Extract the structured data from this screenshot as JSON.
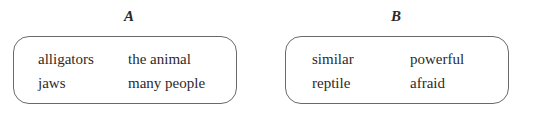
{
  "groups": [
    {
      "label": "A",
      "words": [
        "alligators",
        "the animal",
        "jaws",
        "many people"
      ]
    },
    {
      "label": "B",
      "words": [
        "similar",
        "powerful",
        "reptile",
        "afraid"
      ]
    }
  ]
}
